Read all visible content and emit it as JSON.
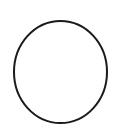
{
  "canvas": {
    "width": 119,
    "height": 131,
    "background_color": "#ffffff"
  },
  "figure": {
    "kind": "line-drawing",
    "shape_count": 1
  },
  "shapes": [
    {
      "name": "circle-outline",
      "type": "ellipse",
      "center_x": 60.5,
      "center_y": 72,
      "radius_x": 46.5,
      "radius_y": 51,
      "bounds": {
        "left": 14,
        "top": 21,
        "right": 107,
        "bottom": 123
      },
      "stroke_color": "#1a1a1a",
      "stroke_width": 2,
      "fill": "none"
    }
  ],
  "text": [],
  "labels": []
}
